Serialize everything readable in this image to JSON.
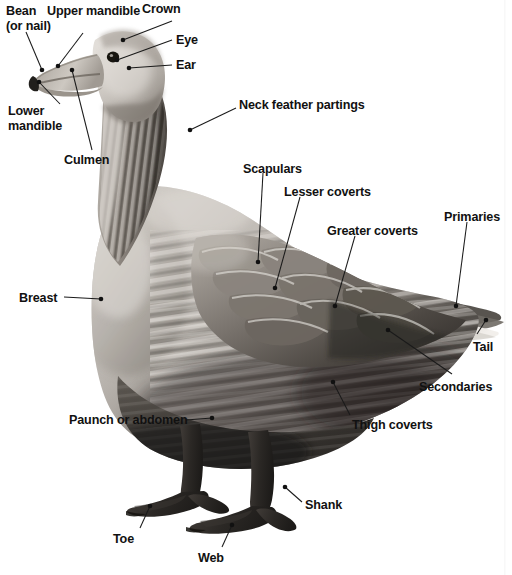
{
  "figure": {
    "type": "anatomical-diagram",
    "view": "lateral / side profile",
    "background_color": "#ffffff",
    "text_color": "#111111",
    "leader_line_color": "#1a1a1a",
    "image_style": "black-and-white photograph"
  },
  "labels": [
    {
      "id": "bean",
      "text": "Bean",
      "text2": "(or nail)",
      "x": 6,
      "y": 4,
      "multiline": true
    },
    {
      "id": "upper-mandible",
      "text": "Upper mandible",
      "x": 47,
      "y": 4
    },
    {
      "id": "crown",
      "text": "Crown",
      "x": 142,
      "y": 2
    },
    {
      "id": "eye",
      "text": "Eye",
      "x": 176,
      "y": 33
    },
    {
      "id": "ear",
      "text": "Ear",
      "x": 176,
      "y": 58
    },
    {
      "id": "lower-mandible",
      "text": "Lower",
      "text2": "mandible",
      "x": 8,
      "y": 104,
      "multiline": true
    },
    {
      "id": "culmen",
      "text": "Culmen",
      "x": 64,
      "y": 153
    },
    {
      "id": "neck-feather-partings",
      "text": "Neck feather partings",
      "x": 239,
      "y": 98
    },
    {
      "id": "scapulars",
      "text": "Scapulars",
      "x": 243,
      "y": 162
    },
    {
      "id": "lesser-coverts",
      "text": "Lesser coverts",
      "x": 284,
      "y": 185
    },
    {
      "id": "greater-coverts",
      "text": "Greater coverts",
      "x": 327,
      "y": 224
    },
    {
      "id": "primaries",
      "text": "Primaries",
      "x": 444,
      "y": 210
    },
    {
      "id": "breast",
      "text": "Breast",
      "x": 19,
      "y": 291
    },
    {
      "id": "tail",
      "text": "Tail",
      "x": 473,
      "y": 340
    },
    {
      "id": "secondaries",
      "text": "Secondaries",
      "x": 419,
      "y": 380
    },
    {
      "id": "paunch-or-abdomen",
      "text": "Paunch or abdomen",
      "x": 69,
      "y": 413
    },
    {
      "id": "thigh-coverts",
      "text": "Thigh coverts",
      "x": 352,
      "y": 418
    },
    {
      "id": "shank",
      "text": "Shank",
      "x": 305,
      "y": 498
    },
    {
      "id": "toe",
      "text": "Toe",
      "x": 113,
      "y": 532
    },
    {
      "id": "web",
      "text": "Web",
      "x": 198,
      "y": 551
    }
  ],
  "leaders": [
    {
      "id": "leader-bean",
      "points": "26,32 42,70",
      "dot": "42,70"
    },
    {
      "id": "leader-upper-mandible",
      "points": "83,33 58,66",
      "dot": "58,66"
    },
    {
      "id": "leader-crown",
      "points": "172,21 123,40",
      "dot": "123,40"
    },
    {
      "id": "leader-eye",
      "points": "172,40 117,60",
      "dot": "117,60"
    },
    {
      "id": "leader-ear",
      "points": "172,65 129,68",
      "dot": "129,68"
    },
    {
      "id": "leader-lower-mandible",
      "points": "60,104 39,82",
      "dot": "39,82"
    },
    {
      "id": "leader-culmen",
      "points": "92,150 72,70",
      "dot": "72,70"
    },
    {
      "id": "leader-neck-feather-partings",
      "points": "236,108 190,130",
      "dot": "190,130"
    },
    {
      "id": "leader-scapulars",
      "points": "263,173 258,262",
      "dot": "258,262"
    },
    {
      "id": "leader-lesser-coverts",
      "points": "300,197 275,288",
      "dot": "275,288"
    },
    {
      "id": "leader-greater-coverts",
      "points": "355,236 335,306",
      "dot": "335,306"
    },
    {
      "id": "leader-primaries",
      "points": "467,222 456,306",
      "dot": "456,306"
    },
    {
      "id": "leader-breast",
      "points": "64,297 101,299",
      "dot": "101,299"
    },
    {
      "id": "leader-tail",
      "points": "477,334 486,320",
      "dot": "486,320"
    },
    {
      "id": "leader-secondaries",
      "points": "452,374 388,330",
      "dot": "388,330"
    },
    {
      "id": "leader-paunch-or-abdomen",
      "points": "186,420 212,418",
      "dot": "212,418"
    },
    {
      "id": "leader-thigh-coverts",
      "points": "350,415 333,382",
      "dot": "333,382"
    },
    {
      "id": "leader-shank",
      "points": "302,502 285,487",
      "dot": "285,487"
    },
    {
      "id": "leader-toe",
      "points": "140,528 150,506",
      "dot": "150,506"
    },
    {
      "id": "leader-web",
      "points": "222,547 232,525",
      "dot": "232,525"
    }
  ]
}
